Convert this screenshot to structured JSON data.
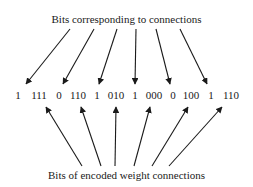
{
  "diagram": {
    "top_label": "Bits corresponding to connections",
    "bottom_label": "Bits of encoded weight connections",
    "bit_groups": [
      {
        "text": "1",
        "x": 18
      },
      {
        "text": "111",
        "x": 39
      },
      {
        "text": "0",
        "x": 59
      },
      {
        "text": "110",
        "x": 78
      },
      {
        "text": "1",
        "x": 97
      },
      {
        "text": "010",
        "x": 116
      },
      {
        "text": "1",
        "x": 135
      },
      {
        "text": "000",
        "x": 154
      },
      {
        "text": "0",
        "x": 173
      },
      {
        "text": "100",
        "x": 191
      },
      {
        "text": "1",
        "x": 211
      },
      {
        "text": "110",
        "x": 231
      }
    ],
    "top_arrows": [
      {
        "x1": 70,
        "y1": 29,
        "x2": 26,
        "y2": 84
      },
      {
        "x1": 94,
        "y1": 29,
        "x2": 63,
        "y2": 84
      },
      {
        "x1": 117,
        "y1": 29,
        "x2": 99,
        "y2": 84
      },
      {
        "x1": 136,
        "y1": 29,
        "x2": 135,
        "y2": 84
      },
      {
        "x1": 156,
        "y1": 29,
        "x2": 170,
        "y2": 84
      },
      {
        "x1": 180,
        "y1": 29,
        "x2": 207,
        "y2": 84
      }
    ],
    "bottom_arrows": [
      {
        "x1": 82,
        "y1": 166,
        "x2": 46,
        "y2": 107
      },
      {
        "x1": 101,
        "y1": 166,
        "x2": 81,
        "y2": 107
      },
      {
        "x1": 115,
        "y1": 166,
        "x2": 116,
        "y2": 107
      },
      {
        "x1": 134,
        "y1": 166,
        "x2": 150,
        "y2": 107
      },
      {
        "x1": 152,
        "y1": 166,
        "x2": 188,
        "y2": 107
      },
      {
        "x1": 169,
        "y1": 166,
        "x2": 222,
        "y2": 107
      }
    ],
    "line_color": "#1a1a1a"
  }
}
